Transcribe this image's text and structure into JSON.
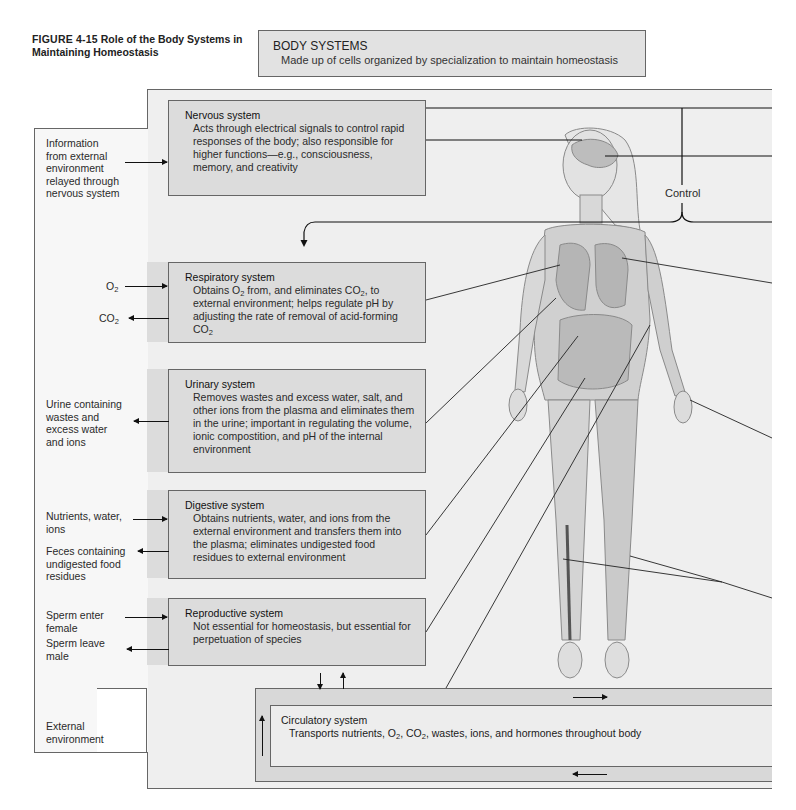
{
  "figure": {
    "number": "FIGURE 4-15",
    "title": "Role of the Body Systems in Maintaining Homeostasis"
  },
  "body_systems": {
    "heading": "BODY SYSTEMS",
    "description": "Made up of cells organized by specialization to maintain homeostasis"
  },
  "control_label": "Control",
  "external_environment": {
    "label_line1": "External",
    "label_line2": "environment"
  },
  "systems": [
    {
      "name": "Nervous system",
      "description": "Acts through electrical signals to control rapid responses of the body; also responsible for higher functions—e.g., consciousness, memory, and creativity"
    },
    {
      "name": "Respiratory system",
      "description_parts": [
        "Obtains O",
        "2",
        " from, and eliminates CO",
        "2",
        ", to external environment; helps regulate pH by adjusting the rate of removal of acid-forming CO",
        "2"
      ]
    },
    {
      "name": "Urinary system",
      "description": "Removes wastes and excess water, salt, and other ions from the plasma and eliminates them in the urine; important in regulating the volume, ionic compostition, and pH of the internal environment"
    },
    {
      "name": "Digestive system",
      "description": "Obtains nutrients, water, and ions from the external environment and transfers them into the plasma; eliminates undigested food residues to external environment"
    },
    {
      "name": "Reproductive system",
      "description": "Not essential for homeostasis, but essential for perpetuation of species"
    },
    {
      "name": "Circulatory system",
      "description_parts": [
        "Transports nutrients, O",
        "2",
        ", CO",
        "2",
        ", wastes, ions, and hormones throughout body"
      ]
    }
  ],
  "exchanges": {
    "nervous_in": [
      "Information",
      "from external",
      "environment",
      "relayed through",
      "nervous system"
    ],
    "resp_in": [
      "O",
      "2"
    ],
    "resp_out": [
      "CO",
      "2"
    ],
    "urinary_out": [
      "Urine containing",
      "wastes and",
      "excess water",
      "and ions"
    ],
    "digestive_in": [
      "Nutrients, water,",
      "ions"
    ],
    "digestive_out": [
      "Feces containing",
      "undigested food",
      "residues"
    ],
    "repro_in": [
      "Sperm enter",
      "female"
    ],
    "repro_out": [
      "Sperm leave",
      "male"
    ]
  },
  "colors": {
    "panel_bg": "#efefef",
    "system_box_bg": "#dcdcdc",
    "border": "#666666",
    "line": "#111111"
  }
}
